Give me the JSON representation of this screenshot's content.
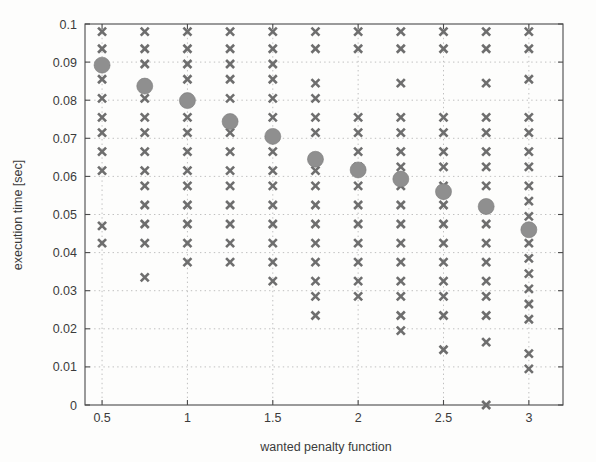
{
  "chart_data": {
    "type": "scatter",
    "title": "",
    "xlabel": "wanted penalty function",
    "ylabel": "execution time [sec]",
    "xlim": [
      0.4,
      3.2
    ],
    "ylim": [
      0,
      0.1
    ],
    "xticks": [
      0.5,
      1,
      1.5,
      2,
      2.5,
      3
    ],
    "xticklabels": [
      "0.5",
      "1",
      "1.5",
      "2",
      "2.5",
      "3"
    ],
    "yticks": [
      0,
      0.01,
      0.02,
      0.03,
      0.04,
      0.05,
      0.06,
      0.07,
      0.08,
      0.09,
      0.1
    ],
    "yticklabels": [
      "0",
      "0.01",
      "0.02",
      "0.03",
      "0.04",
      "0.05",
      "0.06",
      "0.07",
      "0.08",
      "0.09",
      "0.1"
    ],
    "grid": true,
    "grid_style": "dotted",
    "marker_color": "#6e6e6e",
    "mean_color": "#8f8f8f",
    "series": [
      {
        "name": "samples",
        "marker": "x",
        "points": [
          {
            "x": 0.5,
            "y": 0.098
          },
          {
            "x": 0.5,
            "y": 0.0935
          },
          {
            "x": 0.5,
            "y": 0.0855
          },
          {
            "x": 0.5,
            "y": 0.0805
          },
          {
            "x": 0.5,
            "y": 0.0755
          },
          {
            "x": 0.5,
            "y": 0.0715
          },
          {
            "x": 0.5,
            "y": 0.0665
          },
          {
            "x": 0.5,
            "y": 0.0615
          },
          {
            "x": 0.5,
            "y": 0.047
          },
          {
            "x": 0.5,
            "y": 0.0425
          },
          {
            "x": 0.75,
            "y": 0.098
          },
          {
            "x": 0.75,
            "y": 0.0935
          },
          {
            "x": 0.75,
            "y": 0.0895
          },
          {
            "x": 0.75,
            "y": 0.0805
          },
          {
            "x": 0.75,
            "y": 0.0755
          },
          {
            "x": 0.75,
            "y": 0.0715
          },
          {
            "x": 0.75,
            "y": 0.0665
          },
          {
            "x": 0.75,
            "y": 0.0615
          },
          {
            "x": 0.75,
            "y": 0.0575
          },
          {
            "x": 0.75,
            "y": 0.0525
          },
          {
            "x": 0.75,
            "y": 0.0475
          },
          {
            "x": 0.75,
            "y": 0.0425
          },
          {
            "x": 0.75,
            "y": 0.0335
          },
          {
            "x": 1.0,
            "y": 0.098
          },
          {
            "x": 1.0,
            "y": 0.0935
          },
          {
            "x": 1.0,
            "y": 0.0895
          },
          {
            "x": 1.0,
            "y": 0.0855
          },
          {
            "x": 1.0,
            "y": 0.0795
          },
          {
            "x": 1.0,
            "y": 0.0755
          },
          {
            "x": 1.0,
            "y": 0.0715
          },
          {
            "x": 1.0,
            "y": 0.0665
          },
          {
            "x": 1.0,
            "y": 0.0615
          },
          {
            "x": 1.0,
            "y": 0.0575
          },
          {
            "x": 1.0,
            "y": 0.0525
          },
          {
            "x": 1.0,
            "y": 0.0475
          },
          {
            "x": 1.0,
            "y": 0.0425
          },
          {
            "x": 1.0,
            "y": 0.0375
          },
          {
            "x": 1.25,
            "y": 0.098
          },
          {
            "x": 1.25,
            "y": 0.0935
          },
          {
            "x": 1.25,
            "y": 0.0895
          },
          {
            "x": 1.25,
            "y": 0.0855
          },
          {
            "x": 1.25,
            "y": 0.0805
          },
          {
            "x": 1.25,
            "y": 0.0715
          },
          {
            "x": 1.25,
            "y": 0.0665
          },
          {
            "x": 1.25,
            "y": 0.0615
          },
          {
            "x": 1.25,
            "y": 0.0575
          },
          {
            "x": 1.25,
            "y": 0.0525
          },
          {
            "x": 1.25,
            "y": 0.0475
          },
          {
            "x": 1.25,
            "y": 0.0425
          },
          {
            "x": 1.25,
            "y": 0.0375
          },
          {
            "x": 1.5,
            "y": 0.098
          },
          {
            "x": 1.5,
            "y": 0.0935
          },
          {
            "x": 1.5,
            "y": 0.0895
          },
          {
            "x": 1.5,
            "y": 0.0855
          },
          {
            "x": 1.5,
            "y": 0.0805
          },
          {
            "x": 1.5,
            "y": 0.0755
          },
          {
            "x": 1.5,
            "y": 0.0665
          },
          {
            "x": 1.5,
            "y": 0.0615
          },
          {
            "x": 1.5,
            "y": 0.0575
          },
          {
            "x": 1.5,
            "y": 0.0525
          },
          {
            "x": 1.5,
            "y": 0.0475
          },
          {
            "x": 1.5,
            "y": 0.0425
          },
          {
            "x": 1.5,
            "y": 0.0375
          },
          {
            "x": 1.5,
            "y": 0.0325
          },
          {
            "x": 1.75,
            "y": 0.098
          },
          {
            "x": 1.75,
            "y": 0.0935
          },
          {
            "x": 1.75,
            "y": 0.0845
          },
          {
            "x": 1.75,
            "y": 0.0805
          },
          {
            "x": 1.75,
            "y": 0.0755
          },
          {
            "x": 1.75,
            "y": 0.0715
          },
          {
            "x": 1.75,
            "y": 0.0615
          },
          {
            "x": 1.75,
            "y": 0.0575
          },
          {
            "x": 1.75,
            "y": 0.0525
          },
          {
            "x": 1.75,
            "y": 0.0475
          },
          {
            "x": 1.75,
            "y": 0.0425
          },
          {
            "x": 1.75,
            "y": 0.0375
          },
          {
            "x": 1.75,
            "y": 0.0325
          },
          {
            "x": 1.75,
            "y": 0.0285
          },
          {
            "x": 1.75,
            "y": 0.0235
          },
          {
            "x": 2.0,
            "y": 0.098
          },
          {
            "x": 2.0,
            "y": 0.0935
          },
          {
            "x": 2.0,
            "y": 0.0755
          },
          {
            "x": 2.0,
            "y": 0.0715
          },
          {
            "x": 2.0,
            "y": 0.0665
          },
          {
            "x": 2.0,
            "y": 0.0625
          },
          {
            "x": 2.0,
            "y": 0.0575
          },
          {
            "x": 2.0,
            "y": 0.0525
          },
          {
            "x": 2.0,
            "y": 0.0475
          },
          {
            "x": 2.0,
            "y": 0.0425
          },
          {
            "x": 2.0,
            "y": 0.0375
          },
          {
            "x": 2.0,
            "y": 0.0325
          },
          {
            "x": 2.0,
            "y": 0.0285
          },
          {
            "x": 2.25,
            "y": 0.098
          },
          {
            "x": 2.25,
            "y": 0.0935
          },
          {
            "x": 2.25,
            "y": 0.0845
          },
          {
            "x": 2.25,
            "y": 0.0755
          },
          {
            "x": 2.25,
            "y": 0.0715
          },
          {
            "x": 2.25,
            "y": 0.0665
          },
          {
            "x": 2.25,
            "y": 0.0625
          },
          {
            "x": 2.25,
            "y": 0.0575
          },
          {
            "x": 2.25,
            "y": 0.0525
          },
          {
            "x": 2.25,
            "y": 0.0475
          },
          {
            "x": 2.25,
            "y": 0.0425
          },
          {
            "x": 2.25,
            "y": 0.0375
          },
          {
            "x": 2.25,
            "y": 0.0325
          },
          {
            "x": 2.25,
            "y": 0.0285
          },
          {
            "x": 2.25,
            "y": 0.0235
          },
          {
            "x": 2.25,
            "y": 0.0195
          },
          {
            "x": 2.5,
            "y": 0.098
          },
          {
            "x": 2.5,
            "y": 0.0935
          },
          {
            "x": 2.5,
            "y": 0.0755
          },
          {
            "x": 2.5,
            "y": 0.0715
          },
          {
            "x": 2.5,
            "y": 0.0665
          },
          {
            "x": 2.5,
            "y": 0.0625
          },
          {
            "x": 2.5,
            "y": 0.0575
          },
          {
            "x": 2.5,
            "y": 0.0525
          },
          {
            "x": 2.5,
            "y": 0.0475
          },
          {
            "x": 2.5,
            "y": 0.0425
          },
          {
            "x": 2.5,
            "y": 0.0375
          },
          {
            "x": 2.5,
            "y": 0.0325
          },
          {
            "x": 2.5,
            "y": 0.0285
          },
          {
            "x": 2.5,
            "y": 0.0235
          },
          {
            "x": 2.5,
            "y": 0.0145
          },
          {
            "x": 2.75,
            "y": 0.098
          },
          {
            "x": 2.75,
            "y": 0.0935
          },
          {
            "x": 2.75,
            "y": 0.0845
          },
          {
            "x": 2.75,
            "y": 0.0755
          },
          {
            "x": 2.75,
            "y": 0.0715
          },
          {
            "x": 2.75,
            "y": 0.0665
          },
          {
            "x": 2.75,
            "y": 0.0625
          },
          {
            "x": 2.75,
            "y": 0.0575
          },
          {
            "x": 2.75,
            "y": 0.0525
          },
          {
            "x": 2.75,
            "y": 0.0475
          },
          {
            "x": 2.75,
            "y": 0.0425
          },
          {
            "x": 2.75,
            "y": 0.0375
          },
          {
            "x": 2.75,
            "y": 0.0325
          },
          {
            "x": 2.75,
            "y": 0.0285
          },
          {
            "x": 2.75,
            "y": 0.0235
          },
          {
            "x": 2.75,
            "y": 0.0165
          },
          {
            "x": 2.75,
            "y": 0.0
          },
          {
            "x": 3.0,
            "y": 0.098
          },
          {
            "x": 3.0,
            "y": 0.0935
          },
          {
            "x": 3.0,
            "y": 0.0855
          },
          {
            "x": 3.0,
            "y": 0.0755
          },
          {
            "x": 3.0,
            "y": 0.0715
          },
          {
            "x": 3.0,
            "y": 0.0665
          },
          {
            "x": 3.0,
            "y": 0.0625
          },
          {
            "x": 3.0,
            "y": 0.0575
          },
          {
            "x": 3.0,
            "y": 0.0535
          },
          {
            "x": 3.0,
            "y": 0.0495
          },
          {
            "x": 3.0,
            "y": 0.0425
          },
          {
            "x": 3.0,
            "y": 0.0385
          },
          {
            "x": 3.0,
            "y": 0.0345
          },
          {
            "x": 3.0,
            "y": 0.0305
          },
          {
            "x": 3.0,
            "y": 0.0265
          },
          {
            "x": 3.0,
            "y": 0.0225
          },
          {
            "x": 3.0,
            "y": 0.0135
          },
          {
            "x": 3.0,
            "y": 0.0095
          }
        ]
      },
      {
        "name": "mean",
        "marker": "o",
        "points": [
          {
            "x": 0.5,
            "y": 0.0892
          },
          {
            "x": 0.75,
            "y": 0.0837
          },
          {
            "x": 1.0,
            "y": 0.0799
          },
          {
            "x": 1.25,
            "y": 0.0744
          },
          {
            "x": 1.5,
            "y": 0.0705
          },
          {
            "x": 1.75,
            "y": 0.0645
          },
          {
            "x": 2.0,
            "y": 0.0617
          },
          {
            "x": 2.25,
            "y": 0.0593
          },
          {
            "x": 2.5,
            "y": 0.056
          },
          {
            "x": 2.75,
            "y": 0.0521
          },
          {
            "x": 3.0,
            "y": 0.046
          }
        ]
      }
    ]
  }
}
